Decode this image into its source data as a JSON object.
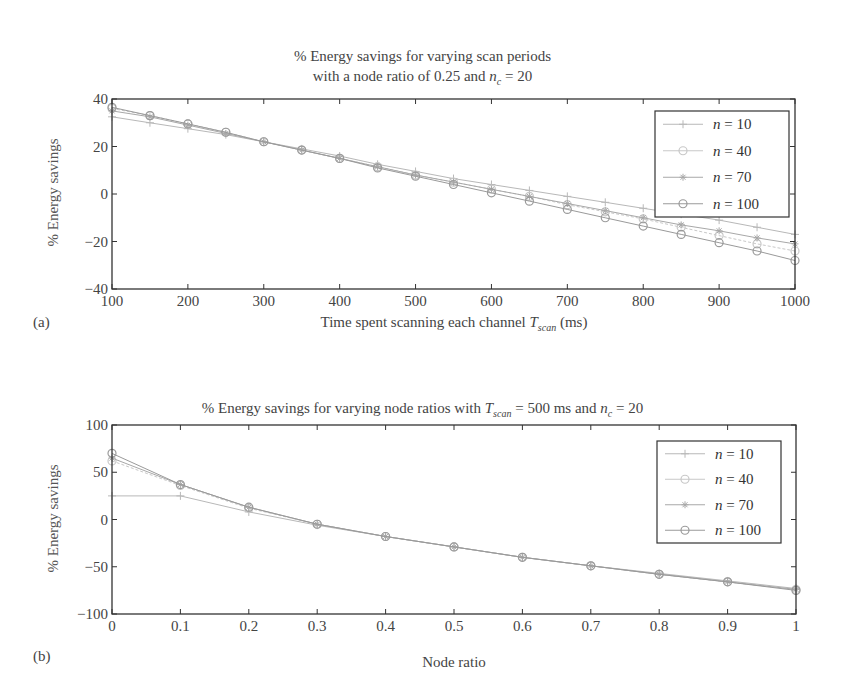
{
  "chart_data": [
    {
      "type": "line",
      "panel": "(a)",
      "title": "% Energy savings for varying scan periods with a node ratio of 0.25 and n_c = 20",
      "title_line1": "% Energy savings for varying scan periods",
      "title_line2_prefix": "with a node ratio of 0.25 and ",
      "title_line2_var": "n",
      "title_line2_sub": "c",
      "title_line2_suffix": " = 20",
      "xlabel": "Time spent scanning each channel T_scan (ms)",
      "xlabel_prefix": "Time spent scanning each channel ",
      "xlabel_var": "T",
      "xlabel_sub": "scan",
      "xlabel_suffix": " (ms)",
      "ylabel": "% Energy savings",
      "xlim": [
        100,
        1000
      ],
      "ylim": [
        -40,
        40
      ],
      "xticks": [
        100,
        200,
        300,
        400,
        500,
        600,
        700,
        800,
        900,
        1000
      ],
      "yticks": [
        -40,
        -20,
        0,
        20,
        40
      ],
      "grid": false,
      "legend_position": "upper right",
      "x": [
        100,
        150,
        200,
        250,
        300,
        350,
        400,
        450,
        500,
        550,
        600,
        650,
        700,
        750,
        800,
        850,
        900,
        950,
        1000
      ],
      "series": [
        {
          "name": "n = 10",
          "marker": "+",
          "values": [
            32.5,
            30,
            27.5,
            25,
            22,
            19,
            16,
            12.5,
            9.5,
            6.5,
            4,
            1.5,
            -1,
            -3.5,
            -6,
            -8.5,
            -11,
            -14,
            -17
          ]
        },
        {
          "name": "n = 40",
          "marker": "o",
          "values": [
            36,
            33,
            29.5,
            26,
            22,
            18.5,
            15,
            11.5,
            8,
            5,
            2,
            -1,
            -4.5,
            -7.5,
            -10.5,
            -14,
            -17.5,
            -21,
            -24
          ]
        },
        {
          "name": "n = 70",
          "marker": "*",
          "values": [
            35,
            32.5,
            29,
            25.5,
            22,
            18.5,
            15,
            11.5,
            8,
            5,
            2,
            -1,
            -4,
            -7,
            -10,
            -13,
            -15.5,
            -18.5,
            -21
          ]
        },
        {
          "name": "n = 100",
          "marker": "o",
          "values": [
            36.5,
            33,
            29.5,
            26,
            22,
            18.5,
            15,
            11,
            7.5,
            4,
            0.5,
            -3,
            -6.5,
            -10,
            -13.5,
            -17,
            -20.5,
            -24,
            -28
          ]
        }
      ]
    },
    {
      "type": "line",
      "panel": "(b)",
      "title": "% Energy savings for varying node ratios with T_scan = 500 ms and n_c = 20",
      "title_prefix": "% Energy savings for varying node ratios with ",
      "title_var1": "T",
      "title_sub1": "scan",
      "title_mid": " = 500 ms and ",
      "title_var2": "n",
      "title_sub2": "c",
      "title_suffix": " = 20",
      "xlabel": "Node ratio",
      "ylabel": "% Energy savings",
      "xlim": [
        0,
        1
      ],
      "ylim": [
        -100,
        100
      ],
      "xticks": [
        "0",
        "0.1",
        "0.2",
        "0.3",
        "0.4",
        "0.5",
        "0.6",
        "0.7",
        "0.8",
        "0.9",
        "1"
      ],
      "yticks": [
        -100,
        -50,
        0,
        50,
        100
      ],
      "grid": false,
      "legend_position": "upper right",
      "x": [
        0,
        0.1,
        0.2,
        0.3,
        0.4,
        0.5,
        0.6,
        0.7,
        0.8,
        0.9,
        1.0
      ],
      "series": [
        {
          "name": "n = 10",
          "marker": "+",
          "values": [
            25,
            25,
            8,
            -6,
            -18,
            -29,
            -40,
            -49,
            -57,
            -65,
            -73
          ]
        },
        {
          "name": "n = 40",
          "marker": "o",
          "values": [
            62,
            36,
            12,
            -5,
            -18,
            -29,
            -40,
            -49,
            -58,
            -66,
            -74
          ]
        },
        {
          "name": "n = 70",
          "marker": "*",
          "values": [
            65,
            37,
            13,
            -5,
            -18,
            -29,
            -40,
            -49,
            -58,
            -66,
            -74
          ]
        },
        {
          "name": "n = 100",
          "marker": "o",
          "values": [
            70,
            37,
            13,
            -5,
            -18,
            -29,
            -40,
            -49,
            -58,
            -66,
            -75
          ]
        }
      ]
    }
  ],
  "legend_items": [
    {
      "var": "n",
      "value": " = 10"
    },
    {
      "var": "n",
      "value": " = 40"
    },
    {
      "var": "n",
      "value": " = 70"
    },
    {
      "var": "n",
      "value": " = 100"
    }
  ],
  "series_colors": [
    "#b8b8b8",
    "#c8c8c8",
    "#a8a8a8",
    "#9a9a9a"
  ]
}
